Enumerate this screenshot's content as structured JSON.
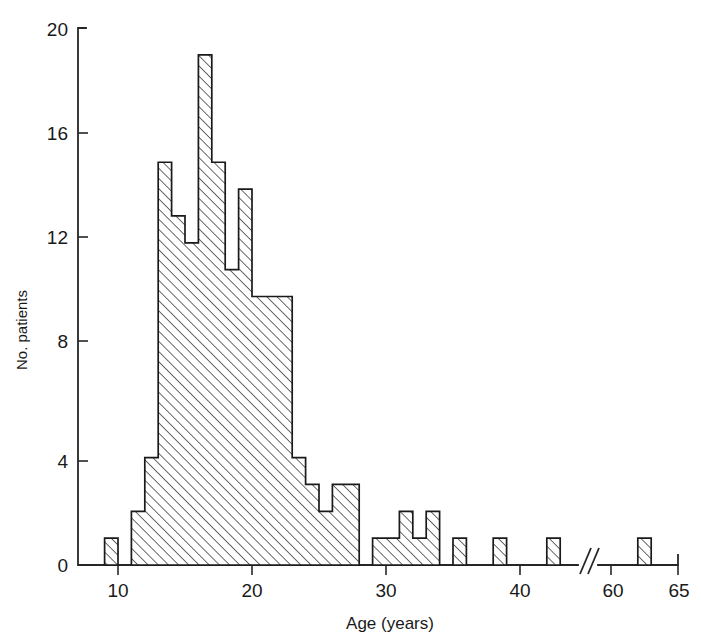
{
  "chart_data": {
    "type": "bar",
    "title": "",
    "subtitle": "",
    "xlabel": "Age (years)",
    "ylabel": "No. patients",
    "xlim": [
      8,
      65
    ],
    "ylim": [
      0,
      20
    ],
    "grid": false,
    "legend": null,
    "axis_break": {
      "present": true,
      "symbol": "//",
      "between": [
        44,
        59
      ]
    },
    "x_ticks": [
      10,
      20,
      30,
      40,
      60,
      65
    ],
    "x_tick_labels": [
      "10",
      "20",
      "30",
      "40",
      "60",
      "65"
    ],
    "y_ticks": [
      0,
      4,
      8,
      12,
      16,
      20
    ],
    "y_tick_labels": [
      "0",
      "4",
      "8",
      "12",
      "16",
      "20"
    ],
    "bin_width": 1,
    "categories": [
      9,
      10,
      11,
      12,
      13,
      14,
      15,
      16,
      17,
      18,
      19,
      20,
      21,
      22,
      23,
      24,
      25,
      26,
      27,
      28,
      29,
      30,
      31,
      32,
      33,
      34,
      35,
      36,
      37,
      38,
      39,
      40,
      41,
      42,
      43,
      62
    ],
    "values": [
      1,
      0,
      2,
      4,
      15,
      13,
      12,
      19,
      15,
      11,
      14,
      10,
      10,
      10,
      4,
      3,
      2,
      3,
      3,
      0,
      1,
      1,
      2,
      1,
      2,
      0,
      1,
      0,
      0,
      1,
      0,
      0,
      0,
      1,
      0,
      1
    ],
    "series": [
      {
        "name": "No. patients",
        "values": [
          1,
          0,
          2,
          4,
          15,
          13,
          12,
          19,
          15,
          11,
          14,
          10,
          10,
          10,
          4,
          3,
          2,
          3,
          3,
          0,
          1,
          1,
          2,
          1,
          2,
          0,
          1,
          0,
          0,
          1,
          0,
          0,
          0,
          1,
          0,
          1
        ]
      }
    ],
    "max_value": 19,
    "max_value_age": 16,
    "fill_style": "diagonal-hatch",
    "colors": {
      "line": "#1a1a1a",
      "hatch": "#333333",
      "background": "#ffffff"
    }
  },
  "axes": {
    "y_axis_label": "No. patients",
    "x_axis_label": "Age (years)",
    "y_tick_labels": [
      "20",
      "16",
      "12",
      "8",
      "4",
      "0"
    ],
    "x_tick_labels": [
      "10",
      "20",
      "30",
      "40",
      "60",
      "65"
    ],
    "break_symbol": "//"
  }
}
